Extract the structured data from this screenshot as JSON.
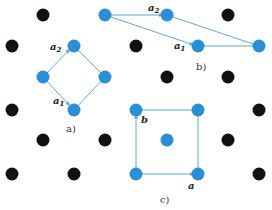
{
  "colors": {
    "background": "#ffffff",
    "lattice_point": "#141010",
    "basis_point": "#2a8fd6",
    "vector_line": "#5aa8dc"
  },
  "lattice": {
    "type": "centered rectangular lattice",
    "points": [
      {
        "x": 43,
        "y": 15,
        "kind": "black"
      },
      {
        "x": 105,
        "y": 15,
        "kind": "blue"
      },
      {
        "x": 167,
        "y": 15,
        "kind": "blue"
      },
      {
        "x": 228,
        "y": 15,
        "kind": "black"
      },
      {
        "x": 12,
        "y": 46,
        "kind": "black"
      },
      {
        "x": 74,
        "y": 46,
        "kind": "blue"
      },
      {
        "x": 136,
        "y": 46,
        "kind": "black"
      },
      {
        "x": 198,
        "y": 46,
        "kind": "blue"
      },
      {
        "x": 259,
        "y": 46,
        "kind": "blue"
      },
      {
        "x": 43,
        "y": 77,
        "kind": "blue"
      },
      {
        "x": 105,
        "y": 77,
        "kind": "blue"
      },
      {
        "x": 167,
        "y": 77,
        "kind": "black"
      },
      {
        "x": 228,
        "y": 77,
        "kind": "black"
      },
      {
        "x": 12,
        "y": 110,
        "kind": "black"
      },
      {
        "x": 74,
        "y": 110,
        "kind": "blue"
      },
      {
        "x": 136,
        "y": 110,
        "kind": "blue"
      },
      {
        "x": 198,
        "y": 110,
        "kind": "blue"
      },
      {
        "x": 259,
        "y": 110,
        "kind": "black"
      },
      {
        "x": 43,
        "y": 140,
        "kind": "black"
      },
      {
        "x": 105,
        "y": 140,
        "kind": "black"
      },
      {
        "x": 167,
        "y": 140,
        "kind": "blue"
      },
      {
        "x": 228,
        "y": 140,
        "kind": "black"
      },
      {
        "x": 12,
        "y": 174,
        "kind": "black"
      },
      {
        "x": 74,
        "y": 174,
        "kind": "black"
      },
      {
        "x": 136,
        "y": 174,
        "kind": "blue"
      },
      {
        "x": 198,
        "y": 174,
        "kind": "blue"
      },
      {
        "x": 259,
        "y": 174,
        "kind": "black"
      }
    ]
  },
  "cells": {
    "a": {
      "caption": "a)",
      "vector1": {
        "name": "a",
        "sub": "1"
      },
      "vector2": {
        "name": "a",
        "sub": "2"
      },
      "description": "primitive rhombic cell"
    },
    "b": {
      "caption": "b)",
      "vector1": {
        "name": "a",
        "sub": "1"
      },
      "vector2": {
        "name": "a",
        "sub": "2"
      },
      "description": "primitive oblique cell"
    },
    "c": {
      "caption": "c)",
      "vector1": {
        "name": "a",
        "sub": ""
      },
      "vector2": {
        "name": "b",
        "sub": ""
      },
      "description": "centered rectangular conventional cell"
    }
  }
}
